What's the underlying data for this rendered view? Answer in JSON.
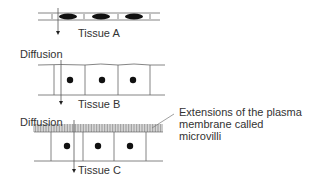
{
  "diagram": {
    "tissues": [
      {
        "id": "A",
        "label": "Tissue A",
        "type": "squamous",
        "cells": 3
      },
      {
        "id": "B",
        "label": "Tissue B",
        "type": "cuboidal",
        "cells": 3
      },
      {
        "id": "C",
        "label": "Tissue C",
        "type": "columnar-with-microvilli",
        "cells": 3
      }
    ],
    "diffusion_labels": [
      "Diffusion",
      "Diffusion"
    ],
    "annotation": {
      "line1": "Extensions of the plasma",
      "line2": "membrane called",
      "line3": "microvilli"
    },
    "colors": {
      "line": "#555555",
      "nucleus": "#111111",
      "background": "#ffffff"
    }
  }
}
